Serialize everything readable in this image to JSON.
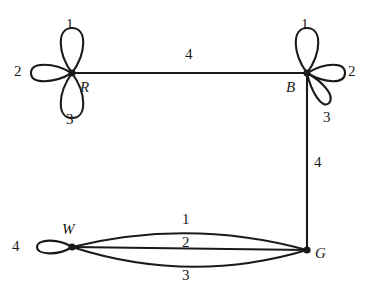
{
  "diagram": {
    "type": "multigraph",
    "title": "",
    "background_color": "#ffffff",
    "stroke_color": "#1a1a1a",
    "vertices": [
      {
        "id": "R",
        "label": "R",
        "x": 72,
        "y": 73,
        "label_x": 80,
        "label_y": 80
      },
      {
        "id": "B",
        "label": "B",
        "x": 307,
        "y": 73,
        "label_x": 286,
        "label_y": 80
      },
      {
        "id": "W",
        "label": "W",
        "x": 72,
        "y": 247,
        "label_x": 62,
        "label_y": 222
      },
      {
        "id": "G",
        "label": "G",
        "x": 307,
        "y": 250,
        "label_x": 315,
        "label_y": 246
      }
    ],
    "loops": [
      {
        "at": "R",
        "label": "1",
        "direction": "up",
        "label_x": 66,
        "label_y": 17
      },
      {
        "at": "R",
        "label": "2",
        "direction": "left",
        "label_x": 14,
        "label_y": 64
      },
      {
        "at": "R",
        "label": "3",
        "direction": "down",
        "label_x": 66,
        "label_y": 112
      },
      {
        "at": "B",
        "label": "1",
        "direction": "up",
        "label_x": 301,
        "label_y": 17
      },
      {
        "at": "B",
        "label": "2",
        "direction": "right",
        "label_x": 348,
        "label_y": 64
      },
      {
        "at": "B",
        "label": "3",
        "direction": "down-right",
        "label_x": 323,
        "label_y": 110
      },
      {
        "at": "W",
        "label": "4",
        "direction": "left",
        "label_x": 12,
        "label_y": 239
      }
    ],
    "edges": [
      {
        "from": "R",
        "to": "B",
        "label": "4",
        "shape": "straight",
        "label_x": 185,
        "label_y": 47
      },
      {
        "from": "B",
        "to": "G",
        "label": "4",
        "shape": "straight",
        "label_x": 314,
        "label_y": 155
      },
      {
        "from": "W",
        "to": "G",
        "label": "1",
        "shape": "arc-up",
        "label_x": 182,
        "label_y": 212
      },
      {
        "from": "W",
        "to": "G",
        "label": "2",
        "shape": "straight",
        "label_x": 182,
        "label_y": 235
      },
      {
        "from": "W",
        "to": "G",
        "label": "3",
        "shape": "arc-down",
        "label_x": 182,
        "label_y": 268
      }
    ]
  }
}
